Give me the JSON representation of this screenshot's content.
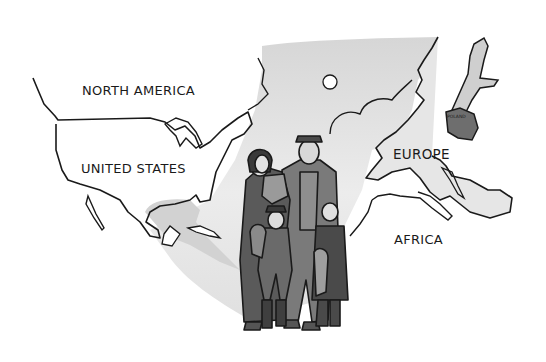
{
  "illustration": {
    "subject": "Immigrant family in front of a map showing migration route from Europe to North America",
    "labels": {
      "north_america": "NORTH AMERICA",
      "united_states": "UNITED STATES",
      "europe": "EUROPE",
      "africa": "AFRICA",
      "poland": "POLAND"
    },
    "colors": {
      "background": "#ffffff",
      "ink": "#1a1a1a",
      "route_shade": "#d9d9d9",
      "land_shade": "#cfcfcf",
      "poland_fill": "#6e6e6e",
      "coat_dark": "#5a5a5a",
      "coat_mid": "#7a7a7a",
      "coat_light": "#9a9a9a"
    }
  }
}
